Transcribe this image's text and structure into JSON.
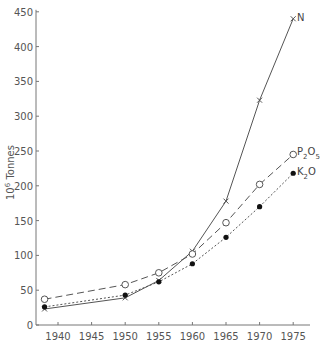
{
  "chart_data": {
    "type": "line",
    "title": "",
    "xlabel": "",
    "ylabel": "10^6 Tonnes",
    "xlim": [
      1937,
      1977
    ],
    "ylim": [
      0,
      450
    ],
    "x_ticks": [
      1940,
      1945,
      1950,
      1955,
      1960,
      1965,
      1970,
      1975
    ],
    "y_ticks": [
      0,
      50,
      100,
      150,
      200,
      250,
      300,
      350,
      400,
      450
    ],
    "grid": false,
    "legend": "inline labels at line ends",
    "series": [
      {
        "name": "N",
        "marker": "x",
        "line": "solid",
        "x": [
          1938,
          1950,
          1955,
          1960,
          1965,
          1970,
          1975
        ],
        "values": [
          23,
          39,
          64,
          106,
          178,
          323,
          440
        ]
      },
      {
        "name": "P2O5",
        "marker": "open-circle",
        "line": "dashed",
        "x": [
          1938,
          1950,
          1955,
          1960,
          1965,
          1970,
          1975
        ],
        "values": [
          37,
          58,
          75,
          102,
          147,
          202,
          245
        ]
      },
      {
        "name": "K2O",
        "marker": "filled-circle",
        "line": "dotted",
        "x": [
          1938,
          1950,
          1955,
          1960,
          1965,
          1970,
          1975
        ],
        "values": [
          26,
          43,
          62,
          88,
          126,
          170,
          218
        ]
      }
    ]
  },
  "labels": {
    "ylabel_base": "10",
    "ylabel_exp": "6",
    "ylabel_unit": " Tonnes",
    "N": "N",
    "P2O5_a": "P",
    "P2O5_b": "2",
    "P2O5_c": "O",
    "P2O5_d": "5",
    "K2O_a": "K",
    "K2O_b": "2",
    "K2O_c": "O"
  },
  "colors": {
    "axis": "#777777",
    "line": "#555555",
    "text": "#555555"
  }
}
